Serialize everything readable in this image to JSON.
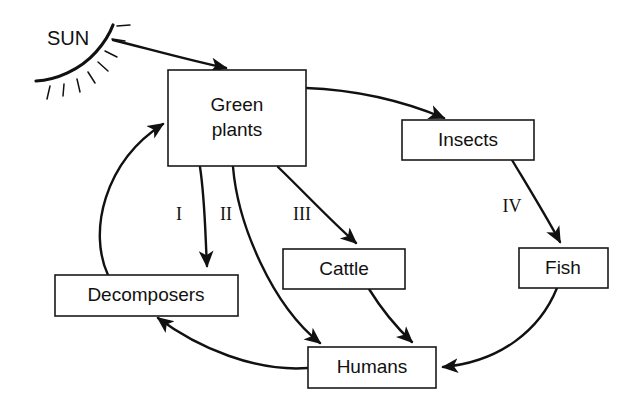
{
  "diagram": {
    "background_color": "#ffffff",
    "stroke_color": "#111111",
    "box_fill_color": "#ffffff",
    "sun": {
      "label": "SUN",
      "label_x": 68,
      "label_y": 40,
      "ray_count": 8
    },
    "nodes": [
      {
        "id": "green-plants",
        "label_line1": "Green",
        "label_line2": "plants",
        "x": 168,
        "y": 70,
        "w": 138,
        "h": 96,
        "two_line": true
      },
      {
        "id": "insects",
        "label_line1": "Insects",
        "label_line2": "",
        "x": 402,
        "y": 120,
        "w": 132,
        "h": 40,
        "two_line": false
      },
      {
        "id": "cattle",
        "label_line1": "Cattle",
        "label_line2": "",
        "x": 283,
        "y": 249,
        "w": 122,
        "h": 40,
        "two_line": false
      },
      {
        "id": "fish",
        "label_line1": "Fish",
        "label_line2": "",
        "x": 519,
        "y": 248,
        "w": 89,
        "h": 40,
        "two_line": false
      },
      {
        "id": "decomposers",
        "label_line1": "Decomposers",
        "label_line2": "",
        "x": 55,
        "y": 275,
        "w": 183,
        "h": 41,
        "two_line": false
      },
      {
        "id": "humans",
        "label_line1": "Humans",
        "label_line2": "",
        "x": 308,
        "y": 347,
        "w": 128,
        "h": 41,
        "two_line": false
      }
    ],
    "edges": [
      {
        "id": "sun-to-green-plants",
        "from": "sun",
        "to": "green-plants",
        "label": "",
        "path": "M 113,40 C 160,52 196,62 226,68"
      },
      {
        "id": "green-plants-to-insects",
        "from": "green-plants",
        "to": "insects",
        "label": "",
        "path": "M 306,88 C 360,90 408,103 444,118"
      },
      {
        "id": "green-plants-to-decomposers",
        "from": "green-plants",
        "to": "decomposers",
        "label": "I",
        "path": "M 200,167 C 205,200 205,230 207,266"
      },
      {
        "id": "green-plants-to-humans",
        "from": "green-plants",
        "to": "humans",
        "label": "II",
        "path": "M 233,167 C 238,225 272,305 320,343"
      },
      {
        "id": "green-plants-to-cattle",
        "from": "green-plants",
        "to": "cattle",
        "label": "III",
        "path": "M 278,167 C 302,190 330,220 356,243"
      },
      {
        "id": "insects-to-fish",
        "from": "insects",
        "to": "fish",
        "label": "IV",
        "path": "M 512,160 C 530,190 546,216 560,242"
      },
      {
        "id": "cattle-to-humans",
        "from": "cattle",
        "to": "humans",
        "label": "",
        "path": "M 369,289 C 382,310 396,327 412,342"
      },
      {
        "id": "fish-to-humans",
        "from": "fish",
        "to": "humans",
        "label": "",
        "path": "M 557,288 C 540,330 500,362 443,367"
      },
      {
        "id": "humans-to-decomposers",
        "from": "humans",
        "to": "decomposers",
        "label": "",
        "path": "M 308,368 C 256,372 198,348 158,318"
      },
      {
        "id": "decomposers-to-green-plants",
        "from": "decomposers",
        "to": "green-plants",
        "label": "",
        "path": "M 108,275 C 88,232 104,162 163,124"
      }
    ],
    "edge_labels": [
      {
        "id": "label-I",
        "text": "I",
        "x": 179,
        "y": 216
      },
      {
        "id": "label-II",
        "text": "II",
        "x": 226,
        "y": 216
      },
      {
        "id": "label-III",
        "text": "III",
        "x": 302,
        "y": 216
      },
      {
        "id": "label-IV",
        "text": "IV",
        "x": 512,
        "y": 208
      }
    ]
  }
}
